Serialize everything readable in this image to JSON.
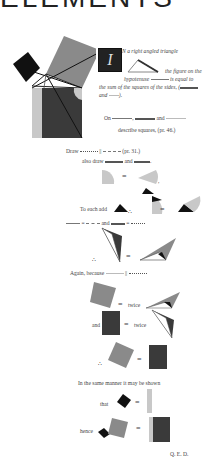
{
  "page": {
    "header_cut": "ELEMENTS",
    "colors": {
      "black": "#111111",
      "dark_grey": "#3a3a3a",
      "mid_grey": "#8a8a8a",
      "light_grey": "#c8c8c8"
    }
  },
  "intro": {
    "drop_cap": "I",
    "line1": "N a right angled triangle",
    "line2": "the figure on the",
    "line3a": "hypotenuse",
    "line3b": "is equal to",
    "line4": "the sum of the squares of the sides, (",
    "line5a": "and",
    "line5b": ")."
  },
  "construction": {
    "on": "On",
    "comma": ",",
    "and": "and",
    "describe": "describe squares, (pr. 46.)",
    "draw": "Draw",
    "parallel": "||",
    "draw_ref": "(pr. 31.)",
    "also_draw": "also draw",
    "also_and": "and",
    "period": "."
  },
  "proof": {
    "to_each_add": "To each add",
    "therefore": "∴",
    "equals": "=",
    "and": "and",
    "again_because": "Again, because",
    "twice": "twice",
    "and2": "and",
    "same_manner": "In the same manner it may be shown",
    "that": "that",
    "hence": "hence",
    "qed": "Q. E. D."
  }
}
